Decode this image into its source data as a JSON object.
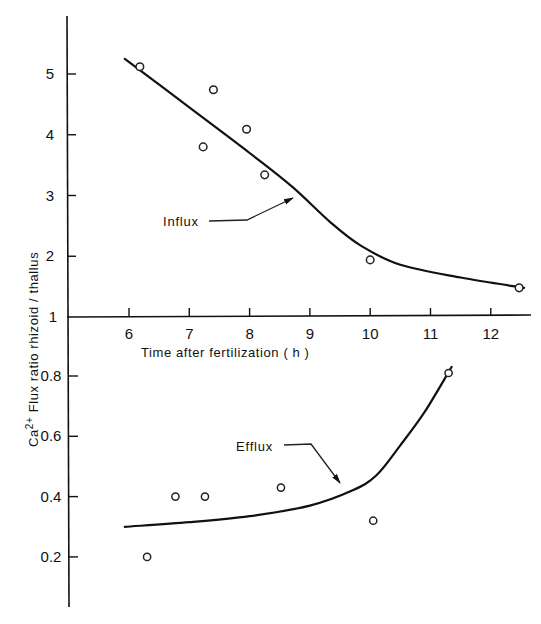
{
  "chart_data": {
    "type": "scatter",
    "title": "",
    "xlabel": "Time after fertilization ( h )",
    "ylabel": "Ca2+ Flux ratio  rhizoid / thallus",
    "ylabel_parts": {
      "base": "Ca",
      "sup": "2+",
      "rest": " Flux ratio  rhizoid / thallus"
    },
    "grid": false,
    "legend": "inline annotations with arrows",
    "panels": [
      {
        "name": "Influx",
        "xlim": [
          5,
          12.7
        ],
        "ylim": [
          1,
          5.9
        ],
        "x_ticks": [
          6,
          7,
          8,
          9,
          10,
          11,
          12
        ],
        "x_tick_labels": [
          "6",
          "7",
          "8",
          "9",
          "10",
          "11",
          "12"
        ],
        "y_ticks": [
          1,
          2,
          3,
          4,
          5
        ],
        "y_tick_labels": [
          "1",
          "2",
          "3",
          "4",
          "5"
        ],
        "points": [
          {
            "x": 6.18,
            "y": 5.12
          },
          {
            "x": 7.23,
            "y": 3.8
          },
          {
            "x": 7.4,
            "y": 4.74
          },
          {
            "x": 7.95,
            "y": 4.09
          },
          {
            "x": 8.25,
            "y": 3.34
          },
          {
            "x": 10.0,
            "y": 1.94
          },
          {
            "x": 12.47,
            "y": 1.48
          }
        ],
        "fit_curve": [
          {
            "x": 5.93,
            "y": 5.25
          },
          {
            "x": 7.0,
            "y": 4.45
          },
          {
            "x": 8.0,
            "y": 3.7
          },
          {
            "x": 8.7,
            "y": 3.15
          },
          {
            "x": 9.35,
            "y": 2.55
          },
          {
            "x": 9.85,
            "y": 2.17
          },
          {
            "x": 10.5,
            "y": 1.86
          },
          {
            "x": 11.5,
            "y": 1.65
          },
          {
            "x": 12.55,
            "y": 1.48
          }
        ],
        "annotation": {
          "label": "Influx",
          "arrow_to": {
            "x": 8.85,
            "y": 3.0
          }
        }
      },
      {
        "name": "Efflux",
        "xlim": [
          5,
          12.7
        ],
        "ylim": [
          0.03,
          0.88
        ],
        "y_ticks": [
          0.2,
          0.4,
          0.6,
          0.8
        ],
        "y_tick_labels": [
          "0.2",
          "0.4",
          "0.6",
          "0.8"
        ],
        "points": [
          {
            "x": 6.3,
            "y": 0.2
          },
          {
            "x": 6.77,
            "y": 0.4
          },
          {
            "x": 7.26,
            "y": 0.4
          },
          {
            "x": 8.52,
            "y": 0.43
          },
          {
            "x": 10.05,
            "y": 0.32
          },
          {
            "x": 11.3,
            "y": 0.81
          }
        ],
        "fit_curve": [
          {
            "x": 5.93,
            "y": 0.3
          },
          {
            "x": 7.0,
            "y": 0.315
          },
          {
            "x": 8.0,
            "y": 0.335
          },
          {
            "x": 9.0,
            "y": 0.37
          },
          {
            "x": 9.7,
            "y": 0.42
          },
          {
            "x": 10.1,
            "y": 0.47
          },
          {
            "x": 10.5,
            "y": 0.57
          },
          {
            "x": 10.9,
            "y": 0.68
          },
          {
            "x": 11.35,
            "y": 0.83
          }
        ],
        "annotation": {
          "label": "Efflux",
          "arrow_to": {
            "x": 9.6,
            "y": 0.41
          }
        }
      }
    ]
  }
}
